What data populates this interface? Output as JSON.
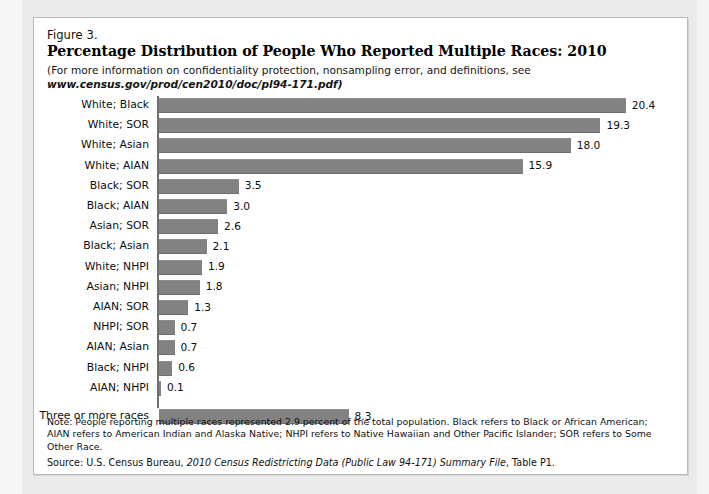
{
  "figure": {
    "number": "Figure 3.",
    "title": "Percentage Distribution of People Who Reported Multiple Races: 2010",
    "subtitle_line1": "(For more information on confidentiality protection, nonsampling error, and definitions, see",
    "subtitle_url": "www.census.gov/prod/cen2010/doc/pl94-171.pdf)"
  },
  "notes": {
    "note_text": "Note: People reporting multiple races represented 2.9 percent of the total population. Black refers to Black or African American; AIAN refers to American Indian and Alaska Native; NHPI refers to Native Hawaiian and Other Pacific Islander; SOR refers to Some Other Race.",
    "source_prefix": "Source: U.S. Census Bureau, ",
    "source_italic": "2010 Census Redistricting Data (Public Law 94-171) Summary File",
    "source_suffix": ", Table P1."
  },
  "colors": {
    "bar_fill": "#828282",
    "axis": "#6f6f6f",
    "card_bg": "#ffffff",
    "page_bg": "#ebebeb"
  },
  "chart_data": {
    "type": "bar",
    "orientation": "horizontal",
    "title": "Percentage Distribution of People Who Reported Multiple Races: 2010",
    "xlabel": "",
    "ylabel": "",
    "xlim": [
      0,
      20.4
    ],
    "grid": false,
    "legend": "none",
    "categories": [
      "White; Black",
      "White; SOR",
      "White; Asian",
      "White; AIAN",
      "Black; SOR",
      "Black; AIAN",
      "Asian; SOR",
      "Black; Asian",
      "White; NHPI",
      "Asian; NHPI",
      "AIAN; SOR",
      "NHPI; SOR",
      "AIAN; Asian",
      "Black; NHPI",
      "AIAN; NHPI",
      "Three or more races"
    ],
    "values": [
      20.4,
      19.3,
      18.0,
      15.9,
      3.5,
      3.0,
      2.6,
      2.1,
      1.9,
      1.8,
      1.3,
      0.7,
      0.7,
      0.6,
      0.1,
      8.3
    ],
    "value_labels": [
      "20.4",
      "19.3",
      "18.0",
      "15.9",
      "3.5",
      "3.0",
      "2.6",
      "2.1",
      "1.9",
      "1.8",
      "1.3",
      "0.7",
      "0.7",
      "0.6",
      "0.1",
      "8.3"
    ],
    "gap_after_index": 14,
    "px_per_unit": 22.9
  }
}
